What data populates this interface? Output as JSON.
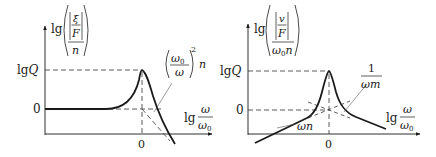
{
  "diagrams": [
    {
      "id": "displacement-response",
      "y_axis": {
        "prefix": "lg",
        "numerator_symbol": "ξ",
        "denominator_symbol": "F",
        "outer_denominator": "n"
      },
      "x_axis": {
        "prefix": "lg",
        "numerator": "ω",
        "denominator": "ω",
        "denominator_subscript": "0"
      },
      "y_ticks": {
        "top": "lgQ",
        "top_prefix": "lg",
        "top_var": "Q",
        "zero": "0"
      },
      "x_tick": "0",
      "asymptote_label": {
        "numerator": "ω",
        "numerator_subscript": "0",
        "denominator": "ω",
        "exponent": "2",
        "suffix": "n"
      }
    },
    {
      "id": "velocity-response",
      "y_axis": {
        "prefix": "lg",
        "numerator_symbol": "v",
        "denominator_symbol": "F",
        "outer_denominator": "ω",
        "outer_denominator_subscript": "0",
        "outer_denominator_suffix": "n"
      },
      "x_axis": {
        "prefix": "lg",
        "numerator": "ω",
        "denominator": "ω",
        "denominator_subscript": "0"
      },
      "y_ticks": {
        "top": "lgQ",
        "top_prefix": "lg",
        "top_var": "Q",
        "zero": "0"
      },
      "x_tick": "0",
      "low_asymptote_label": "ωn",
      "high_asymptote_label": {
        "numerator": "1",
        "denominator": "ωm"
      }
    }
  ],
  "colors": {
    "ink": "#1a1a1a",
    "dash": "#333333",
    "thin": "#555555"
  }
}
